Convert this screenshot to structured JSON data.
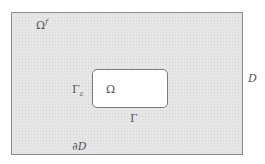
{
  "diagram": {
    "labels": {
      "fluid_domain": "Ω",
      "fluid_domain_sup": "f",
      "gamma_eps": "Γ",
      "gamma_eps_sub": "ε",
      "obstacle": "Ω",
      "boundary_gamma": "Γ",
      "domain": "D",
      "domain_boundary": "∂D"
    },
    "colors": {
      "outer_fill": "#e6e6e6",
      "outer_border": "#8a8a8a",
      "inner_fill": "#ffffff",
      "inner_border": "#7a7a7a",
      "text": "#555555"
    }
  }
}
